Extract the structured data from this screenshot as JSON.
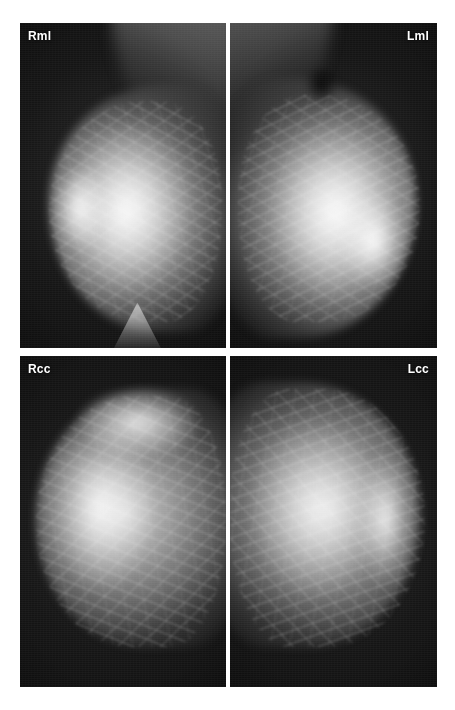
{
  "figure": {
    "background_color": "#ffffff",
    "width": 455,
    "height": 710,
    "modality": "mammogram",
    "layout": "2x2-panel-grid"
  },
  "panels": [
    {
      "id": "rml",
      "label": "Rml",
      "label_align": "left",
      "view": "right mediolateral",
      "side": "right",
      "projection": "ML",
      "nipple_direction": "left",
      "x": 20,
      "y": 23,
      "width": 206,
      "height": 325,
      "film_color": "#0d0d0d",
      "label_color": "#ffffff"
    },
    {
      "id": "lml",
      "label": "Lml",
      "label_align": "right",
      "view": "left mediolateral",
      "side": "left",
      "projection": "ML",
      "nipple_direction": "right",
      "x": 230,
      "y": 23,
      "width": 207,
      "height": 325,
      "film_color": "#0d0d0d",
      "label_color": "#ffffff"
    },
    {
      "id": "rcc",
      "label": "Rcc",
      "label_align": "left",
      "view": "right craniocaudal",
      "side": "right",
      "projection": "CC",
      "nipple_direction": "left",
      "x": 20,
      "y": 356,
      "width": 206,
      "height": 331,
      "film_color": "#0d0d0d",
      "label_color": "#ffffff"
    },
    {
      "id": "lcc",
      "label": "Lcc",
      "label_align": "right",
      "view": "left craniocaudal",
      "side": "left",
      "projection": "CC",
      "nipple_direction": "right",
      "x": 230,
      "y": 356,
      "width": 207,
      "height": 331,
      "film_color": "#0d0d0d",
      "label_color": "#ffffff"
    }
  ]
}
